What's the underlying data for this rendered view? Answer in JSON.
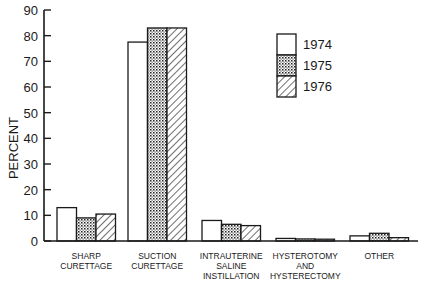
{
  "chart_data": {
    "type": "bar",
    "title": "",
    "xlabel": "",
    "ylabel": "PERCENT",
    "ylim": [
      0,
      90
    ],
    "yticks": [
      0,
      10,
      20,
      30,
      40,
      50,
      60,
      70,
      80,
      90
    ],
    "grid": false,
    "legend_position": "upper right (inside)",
    "categories": [
      [
        "SHARP",
        "CURETTAGE"
      ],
      [
        "SUCTION",
        "CURETTAGE"
      ],
      [
        "INTRAUTERINE",
        "SALINE",
        "INSTILLATION"
      ],
      [
        "HYSTEROTOMY",
        "AND",
        "HYSTERECTOMY"
      ],
      [
        "OTHER"
      ]
    ],
    "series": [
      {
        "name": "1974",
        "pattern": "open",
        "values": [
          13,
          77.5,
          8,
          1,
          2
        ]
      },
      {
        "name": "1975",
        "pattern": "dotted",
        "values": [
          9,
          83,
          6.5,
          0.8,
          3
        ]
      },
      {
        "name": "1976",
        "pattern": "hatched",
        "values": [
          10.5,
          83,
          6,
          0.7,
          1.3
        ]
      }
    ]
  }
}
